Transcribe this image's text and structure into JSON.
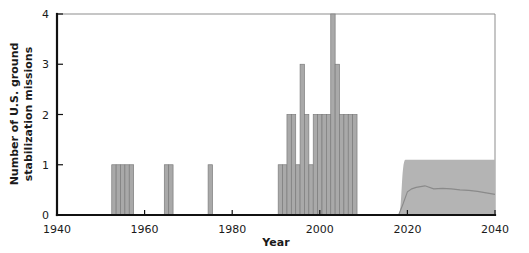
{
  "chart_data": {
    "type": "bar",
    "title": "",
    "xlabel": "Year",
    "ylabel": "Number of U.S. ground stabilization missions",
    "ylabel_line1": "Number of U.S. ground",
    "ylabel_line2": "stabilization missions",
    "xlim": [
      1940,
      2040
    ],
    "ylim": [
      0,
      4
    ],
    "xticks": [
      1940,
      1960,
      1980,
      2000,
      2020,
      2040
    ],
    "xtick_labels": [
      "1940",
      "1960",
      "1980",
      "2000",
      "2020",
      "2040"
    ],
    "yticks": [
      0,
      1,
      2,
      3,
      4
    ],
    "ytick_labels": [
      "0",
      "1",
      "2",
      "3",
      "4"
    ],
    "grid": false,
    "legend": "none",
    "bar_color": "#a9a9a9",
    "bar_edge_color": "#7c7c7c",
    "band_color": "#b4b4b4",
    "median_color": "#8a8a8a",
    "axis_color": "#111111",
    "frame_color": "#8d8d8d",
    "categories": [
      1953,
      1954,
      1955,
      1956,
      1957,
      1965,
      1966,
      1975,
      1991,
      1992,
      1993,
      1994,
      1995,
      1996,
      1997,
      1998,
      1999,
      2000,
      2001,
      2002,
      2003,
      2004,
      2005,
      2006,
      2007,
      2008
    ],
    "values": [
      1,
      1,
      1,
      1,
      1,
      1,
      1,
      1,
      1,
      1,
      2,
      2,
      1,
      3,
      2,
      1,
      2,
      2,
      2,
      2,
      4,
      3,
      2,
      2,
      2,
      2
    ],
    "projection": {
      "label": "projected range",
      "x_start": 2018,
      "x_end": 2040,
      "band_upper": 1.1,
      "band_lower": 0,
      "median_x": [
        2018,
        2019,
        2020,
        2021,
        2022,
        2024,
        2026,
        2028,
        2030,
        2032,
        2034,
        2036,
        2038,
        2040
      ],
      "median_y": [
        0.0,
        0.22,
        0.46,
        0.52,
        0.55,
        0.58,
        0.52,
        0.53,
        0.52,
        0.5,
        0.49,
        0.47,
        0.44,
        0.41
      ]
    }
  }
}
